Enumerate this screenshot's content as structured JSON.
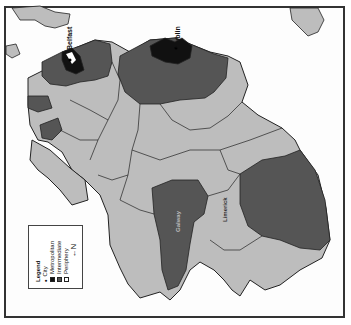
{
  "map": {
    "labels": {
      "belfast": "Belfast",
      "dublin": "Dublin",
      "label_c": "Galway",
      "label_d": "Limerick"
    },
    "colors": {
      "metropolitan": "#111111",
      "intermediate": "#555555",
      "periphery": "#bdbdbd",
      "background": "#ffffff",
      "border": "#222222"
    }
  },
  "legend": {
    "title": "Legend",
    "items": [
      {
        "symbol": "•",
        "label": "City"
      },
      {
        "symbol": "■",
        "label": "Metropolitan"
      },
      {
        "symbol": "■",
        "label": "Intermediate"
      },
      {
        "symbol": "□",
        "label": "Periphery"
      }
    ],
    "north_label": "N",
    "north_arrow": "←"
  }
}
